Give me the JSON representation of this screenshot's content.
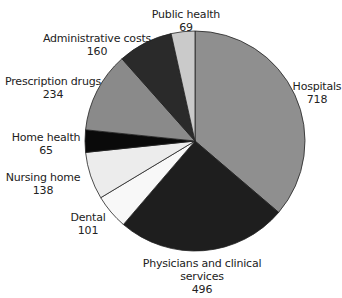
{
  "chart_data": {
    "type": "pie",
    "title": "",
    "start_angle_deg": 0,
    "direction": "clockwise",
    "center": [
      195,
      141
    ],
    "radius": 110,
    "total": 1981,
    "slices": [
      {
        "label": "Hospitals",
        "label_lines": [
          "Hospitals"
        ],
        "value": 718,
        "color": "#8f8f8f",
        "label_pos": [
          317,
          80
        ]
      },
      {
        "label": "Physicians and clinical services",
        "label_lines": [
          "Physicians and clinical",
          "services"
        ],
        "value": 496,
        "color": "#1e1e1e",
        "label_pos": [
          202,
          257
        ]
      },
      {
        "label": "Dental",
        "label_lines": [
          "Dental"
        ],
        "value": 101,
        "color": "#f8f8f8",
        "label_pos": [
          88,
          211
        ]
      },
      {
        "label": "Nursing home",
        "label_lines": [
          "Nursing home"
        ],
        "value": 138,
        "color": "#ececec",
        "label_pos": [
          43,
          171
        ]
      },
      {
        "label": "Home health",
        "label_lines": [
          "Home health"
        ],
        "value": 65,
        "color": "#0a0a0a",
        "label_pos": [
          46,
          131
        ]
      },
      {
        "label": "Prescription drugs",
        "label_lines": [
          "Prescription drugs"
        ],
        "value": 234,
        "color": "#8a8a8a",
        "label_pos": [
          53,
          75
        ]
      },
      {
        "label": "Administrative costs",
        "label_lines": [
          "Administrative costs"
        ],
        "value": 160,
        "color": "#2a2a2a",
        "label_pos": [
          97,
          32
        ]
      },
      {
        "label": "Public health",
        "label_lines": [
          "Public health"
        ],
        "value": 69,
        "color": "#cacaca",
        "label_pos": [
          186,
          8
        ]
      }
    ],
    "legend": null,
    "grid": false
  }
}
